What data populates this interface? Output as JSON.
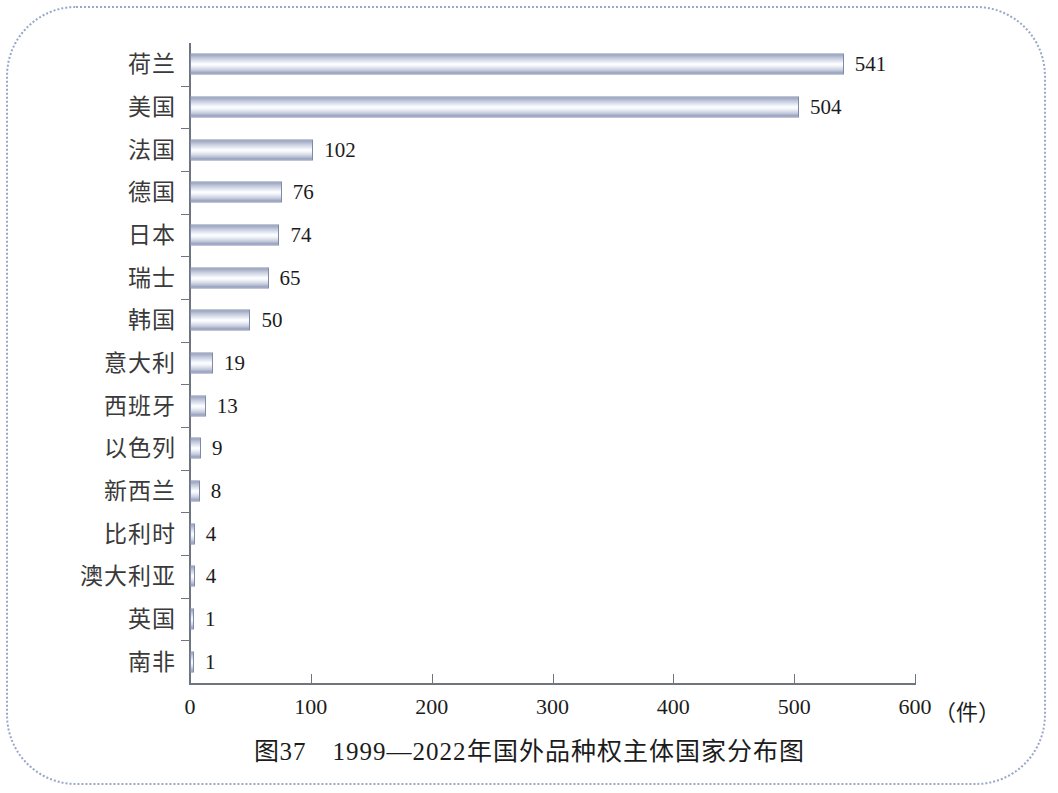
{
  "caption": "图37　1999—2022年国外品种权主体国家分布图",
  "chart_data": {
    "type": "bar",
    "orientation": "horizontal",
    "title": "图37　1999—2022年国外品种权主体国家分布图",
    "xlabel": "（件）",
    "ylabel": "",
    "xlim": [
      0,
      600
    ],
    "ylim": null,
    "grid": false,
    "legend": null,
    "xticks": [
      "0",
      "100",
      "200",
      "300",
      "400",
      "500",
      "600"
    ],
    "xtick_values": [
      0,
      100,
      200,
      300,
      400,
      500,
      600
    ],
    "unit": "（件）",
    "categories": [
      "荷兰",
      "美国",
      "法国",
      "德国",
      "日本",
      "瑞士",
      "韩国",
      "意大利",
      "西班牙",
      "以色列",
      "新西兰",
      "比利时",
      "澳大利亚",
      "英国",
      "南非"
    ],
    "values": [
      541,
      504,
      102,
      76,
      74,
      65,
      50,
      19,
      13,
      9,
      8,
      4,
      4,
      1,
      1
    ],
    "data_labels": [
      "541",
      "504",
      "102",
      "76",
      "74",
      "65",
      "50",
      "19",
      "13",
      "9",
      "8",
      "4",
      "4",
      "1",
      "1"
    ],
    "colors": {
      "bar_gradient_dark": "#97a1bd",
      "bar_gradient_light": "#ffffff",
      "bar_border": "#7f8aa8",
      "axis": "#6f7580",
      "text": "#1c1c1c",
      "frame_border": "#9aa8c8"
    }
  }
}
